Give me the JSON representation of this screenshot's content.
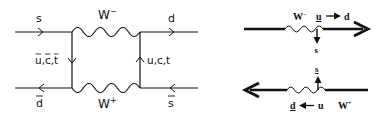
{
  "left_diagram": {
    "title": "Box diagram: K0 - anti-K0 mixing",
    "labels": {
      "in_top": "s",
      "out_top": "d",
      "in_bottom": "d",
      "out_bottom": "s",
      "boson_top": "W",
      "boson_top_charge": "−",
      "boson_bottom": "W",
      "boson_bottom_charge": "+",
      "left_propagator": "u,c,t",
      "right_propagator": "u,c,t"
    }
  },
  "right_diagram": {
    "top": {
      "boson": "W",
      "boson_charge": "−",
      "quark_from": "u",
      "arrow": "→",
      "quark_to": "d",
      "emitted": "s"
    },
    "bottom": {
      "absorbed": "s",
      "quark_to": "d",
      "arrow": "←",
      "quark_from": "u",
      "boson": "W",
      "boson_charge": "+"
    }
  }
}
